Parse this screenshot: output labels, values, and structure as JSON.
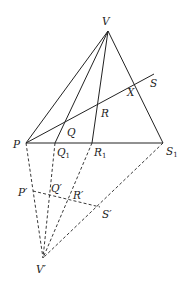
{
  "diagram": {
    "title": "",
    "points": {
      "V": {
        "x": 108,
        "y": 31,
        "label": "V"
      },
      "P": {
        "x": 26,
        "y": 143,
        "label": "P"
      },
      "Q": {
        "x": 65,
        "y": 123,
        "label": "Q"
      },
      "R": {
        "x": 97,
        "y": 106,
        "label": "R"
      },
      "X": {
        "x": 135,
        "y": 84,
        "label": "X"
      },
      "S": {
        "x": 154,
        "y": 74,
        "label": "S"
      },
      "Q1": {
        "x": 55,
        "y": 143,
        "label": "Q",
        "sub": "1"
      },
      "R1": {
        "x": 92,
        "y": 143,
        "label": "R",
        "sub": "1"
      },
      "S1": {
        "x": 163,
        "y": 143,
        "label": "S",
        "sub": "1"
      },
      "Pp": {
        "x": 33,
        "y": 191,
        "label": "P′"
      },
      "Qp": {
        "x": 50,
        "y": 194,
        "label": "Q′"
      },
      "Rp": {
        "x": 68,
        "y": 198,
        "label": "R′"
      },
      "Sp": {
        "x": 100,
        "y": 207,
        "label": "S′"
      },
      "Vp": {
        "x": 43,
        "y": 258,
        "label": "V′"
      }
    },
    "solid_lines": [
      [
        "V",
        "P"
      ],
      [
        "V",
        "Q1"
      ],
      [
        "V",
        "R1"
      ],
      [
        "V",
        "S1"
      ],
      [
        "P",
        "S1"
      ],
      [
        "P",
        "S"
      ]
    ],
    "dashed_lines": [
      [
        "P",
        "Vp"
      ],
      [
        "Q1",
        "Vp"
      ],
      [
        "R1",
        "Vp"
      ],
      [
        "S1",
        "Vp"
      ],
      [
        "Pp",
        "Sp"
      ]
    ]
  }
}
